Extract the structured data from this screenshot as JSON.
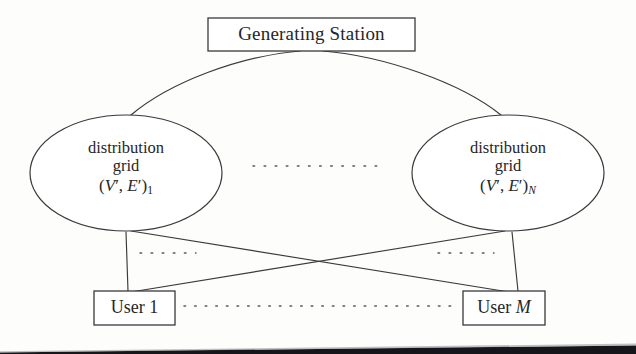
{
  "figure": {
    "caption_present": false,
    "background_color": "#fdfdfc",
    "line_color": "#3a3a3a",
    "dot_color": "#5a5a5a"
  },
  "generating_station": {
    "label": "Generating Station",
    "box": {
      "x": 208,
      "y": 18,
      "width": 207,
      "height": 33
    }
  },
  "distribution_grids": [
    {
      "id": "left",
      "line1": "distribution",
      "line2": "grid",
      "math_open": "(",
      "math_v": "V",
      "math_v_prime": "′",
      "math_comma": ", ",
      "math_e": "E",
      "math_e_prime": "′",
      "math_close": ")",
      "subscript": "1",
      "subscript_italic": false,
      "ellipse": {
        "cx": 126,
        "cy": 173,
        "rx": 96,
        "ry": 58
      }
    },
    {
      "id": "right",
      "line1": "distribution",
      "line2": "grid",
      "math_open": "(",
      "math_v": "V",
      "math_v_prime": "′",
      "math_comma": ", ",
      "math_e": "E",
      "math_e_prime": "′",
      "math_close": ")",
      "subscript": "N",
      "subscript_italic": true,
      "ellipse": {
        "cx": 508,
        "cy": 173,
        "rx": 96,
        "ry": 58
      }
    }
  ],
  "users": [
    {
      "id": "user-first",
      "prefix": "User ",
      "index": "1",
      "index_italic": false,
      "box": {
        "x": 94,
        "y": 291,
        "width": 81,
        "height": 34
      }
    },
    {
      "id": "user-last",
      "prefix": "User ",
      "index": "M",
      "index_italic": true,
      "box": {
        "x": 463,
        "y": 291,
        "width": 82,
        "height": 34
      }
    }
  ],
  "ellipsis_marks": [
    {
      "id": "between-grids",
      "x1": 253,
      "y1": 166,
      "x2": 381,
      "y2": 166,
      "style": "dotted"
    },
    {
      "id": "below-left-grid",
      "x1": 140,
      "y1": 253,
      "x2": 196,
      "y2": 253,
      "style": "dotted"
    },
    {
      "id": "below-right-grid",
      "x1": 438,
      "y1": 253,
      "x2": 494,
      "y2": 253,
      "style": "dotted"
    },
    {
      "id": "between-users",
      "x1": 184,
      "y1": 306,
      "x2": 456,
      "y2": 306,
      "style": "dotted"
    }
  ],
  "connections": [
    {
      "id": "station-to-left-grid",
      "type": "arc",
      "from": "generating-station",
      "to": "distribution-grid-left"
    },
    {
      "id": "station-to-right-grid",
      "type": "arc",
      "from": "generating-station",
      "to": "distribution-grid-right"
    },
    {
      "id": "left-grid-to-user-first",
      "type": "line",
      "from": "distribution-grid-left",
      "to": "user-first"
    },
    {
      "id": "left-grid-to-user-last",
      "type": "line",
      "from": "distribution-grid-left",
      "to": "user-last"
    },
    {
      "id": "right-grid-to-user-first",
      "type": "line",
      "from": "distribution-grid-right",
      "to": "user-first"
    },
    {
      "id": "right-grid-to-user-last",
      "type": "line",
      "from": "distribution-grid-right",
      "to": "user-last"
    }
  ]
}
